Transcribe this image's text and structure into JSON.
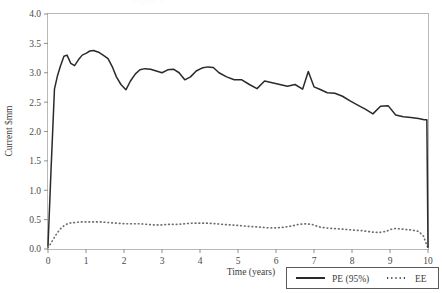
{
  "figure": {
    "ghost_header_text": "Figure 1",
    "background_color": "#ffffff"
  },
  "chart_data": {
    "type": "line",
    "title": "",
    "xlabel": "Time (years)",
    "ylabel": "Current $mm",
    "xlim": [
      0,
      10
    ],
    "ylim": [
      0,
      4.0
    ],
    "xticks": [
      0,
      1,
      2,
      3,
      4,
      5,
      6,
      7,
      8,
      9,
      10
    ],
    "xtick_labels": [
      "0",
      "1",
      "2",
      "3",
      "4",
      "5",
      "6",
      "7",
      "8",
      "9",
      "10"
    ],
    "yticks": [
      0.0,
      0.5,
      1.0,
      1.5,
      2.0,
      2.5,
      3.0,
      3.5,
      4.0
    ],
    "ytick_labels": [
      "0.0",
      "0.5",
      "1.0",
      "1.5",
      "2.0",
      "2.5",
      "3.0",
      "3.5",
      "4.0"
    ],
    "grid": false,
    "legend_position": "bottom-right",
    "colors": {
      "pe": "#2a2a2a",
      "ee": "#6d6d6d",
      "frame": "#b9b9b9",
      "text": "#3c3c3c"
    },
    "series": [
      {
        "name": "PE (95%)",
        "style": "solid",
        "color": "#2a2a2a",
        "x": [
          0.0,
          0.08,
          0.17,
          0.25,
          0.33,
          0.42,
          0.5,
          0.6,
          0.7,
          0.8,
          0.9,
          1.0,
          1.1,
          1.2,
          1.33,
          1.45,
          1.58,
          1.7,
          1.8,
          1.92,
          2.05,
          2.17,
          2.3,
          2.42,
          2.55,
          2.7,
          2.85,
          3.0,
          3.15,
          3.3,
          3.45,
          3.6,
          3.75,
          3.9,
          4.05,
          4.2,
          4.35,
          4.5,
          4.7,
          4.9,
          5.1,
          5.3,
          5.5,
          5.7,
          5.9,
          6.1,
          6.3,
          6.5,
          6.7,
          6.85,
          7.0,
          7.15,
          7.35,
          7.55,
          7.75,
          7.95,
          8.15,
          8.35,
          8.55,
          8.75,
          8.95,
          9.15,
          9.35,
          9.55,
          9.75,
          9.9,
          9.97,
          10.0
        ],
        "y": [
          0.05,
          1.35,
          2.72,
          2.95,
          3.12,
          3.28,
          3.3,
          3.16,
          3.12,
          3.22,
          3.3,
          3.33,
          3.37,
          3.38,
          3.35,
          3.3,
          3.24,
          3.09,
          2.93,
          2.8,
          2.71,
          2.86,
          2.98,
          3.05,
          3.07,
          3.06,
          3.03,
          3.0,
          3.05,
          3.06,
          3.0,
          2.88,
          2.93,
          3.03,
          3.08,
          3.1,
          3.09,
          3.0,
          2.93,
          2.88,
          2.88,
          2.8,
          2.73,
          2.86,
          2.83,
          2.8,
          2.77,
          2.8,
          2.72,
          3.02,
          2.76,
          2.72,
          2.66,
          2.65,
          2.6,
          2.52,
          2.45,
          2.38,
          2.3,
          2.43,
          2.44,
          2.28,
          2.25,
          2.24,
          2.22,
          2.2,
          2.2,
          0.03
        ]
      },
      {
        "name": "EE",
        "style": "dotted",
        "color": "#6d6d6d",
        "x": [
          0.0,
          0.08,
          0.17,
          0.25,
          0.35,
          0.45,
          0.55,
          0.7,
          0.85,
          1.0,
          1.2,
          1.4,
          1.6,
          1.8,
          2.0,
          2.2,
          2.4,
          2.6,
          2.8,
          3.0,
          3.2,
          3.4,
          3.6,
          3.8,
          4.0,
          4.2,
          4.4,
          4.6,
          4.8,
          5.0,
          5.2,
          5.4,
          5.6,
          5.8,
          6.0,
          6.2,
          6.4,
          6.6,
          6.8,
          7.0,
          7.1,
          7.3,
          7.5,
          7.7,
          7.9,
          8.1,
          8.3,
          8.5,
          8.7,
          8.9,
          9.0,
          9.15,
          9.3,
          9.45,
          9.6,
          9.75,
          9.88,
          9.95,
          10.0
        ],
        "y": [
          0.02,
          0.1,
          0.2,
          0.28,
          0.36,
          0.41,
          0.44,
          0.45,
          0.46,
          0.46,
          0.46,
          0.46,
          0.45,
          0.44,
          0.43,
          0.43,
          0.43,
          0.42,
          0.41,
          0.41,
          0.42,
          0.42,
          0.43,
          0.44,
          0.44,
          0.44,
          0.43,
          0.42,
          0.41,
          0.4,
          0.39,
          0.38,
          0.37,
          0.36,
          0.36,
          0.37,
          0.39,
          0.42,
          0.43,
          0.41,
          0.38,
          0.36,
          0.35,
          0.34,
          0.33,
          0.32,
          0.31,
          0.29,
          0.28,
          0.3,
          0.33,
          0.35,
          0.34,
          0.33,
          0.32,
          0.3,
          0.22,
          0.1,
          0.02
        ]
      }
    ],
    "legend": [
      {
        "label": "PE (95%)",
        "style": "solid"
      },
      {
        "label": "EE",
        "style": "dotted"
      }
    ]
  }
}
